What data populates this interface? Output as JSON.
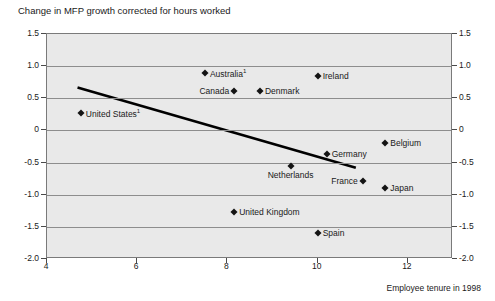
{
  "chart_data": {
    "type": "scatter",
    "title": "Change in MFP growth corrected for hours worked",
    "xlabel": "Employee tenure in 1998",
    "ylabel": "",
    "xlim": [
      4,
      13
    ],
    "ylim": [
      -2.0,
      1.5
    ],
    "xticks": [
      4,
      6,
      8,
      10,
      12
    ],
    "yticks": [
      1.5,
      1.0,
      0.5,
      0,
      -0.5,
      -1.0,
      -1.5,
      -2.0
    ],
    "ytick_labels_left": [
      "1.5",
      "1.0",
      "0.5",
      "0",
      "-0.5",
      "-1.0",
      "-1.5",
      "-2.0"
    ],
    "ytick_labels_right": [
      "1.5",
      "1.0",
      "0.5",
      "0",
      "-0.5",
      "-1.0",
      "-1.5",
      "-2.0"
    ],
    "grid": true,
    "legend": "none",
    "points": [
      {
        "name": "Australia",
        "label": "Australia",
        "footnote": "1",
        "x": 7.5,
        "y": 0.9,
        "label_pos": "right"
      },
      {
        "name": "Ireland",
        "label": "Ireland",
        "footnote": "",
        "x": 10.0,
        "y": 0.85,
        "label_pos": "right"
      },
      {
        "name": "Canada",
        "label": "Canada",
        "footnote": "",
        "x": 8.15,
        "y": 0.62,
        "label_pos": "left"
      },
      {
        "name": "Denmark",
        "label": "Denmark",
        "footnote": "",
        "x": 8.72,
        "y": 0.62,
        "label_pos": "right"
      },
      {
        "name": "United States",
        "label": "United States",
        "footnote": "1",
        "x": 4.75,
        "y": 0.27,
        "label_pos": "right"
      },
      {
        "name": "Belgium",
        "label": "Belgium",
        "footnote": "",
        "x": 11.5,
        "y": -0.2,
        "label_pos": "right"
      },
      {
        "name": "Germany",
        "label": "Germany",
        "footnote": "",
        "x": 10.2,
        "y": -0.37,
        "label_pos": "right"
      },
      {
        "name": "Netherlands",
        "label": "Netherlands",
        "footnote": "",
        "x": 9.4,
        "y": -0.55,
        "label_pos": "below"
      },
      {
        "name": "France",
        "label": "France",
        "footnote": "",
        "x": 11.0,
        "y": -0.78,
        "label_pos": "left"
      },
      {
        "name": "Japan",
        "label": "Japan",
        "footnote": "",
        "x": 11.5,
        "y": -0.9,
        "label_pos": "right"
      },
      {
        "name": "United Kingdom",
        "label": "United Kingdom",
        "footnote": "",
        "x": 8.15,
        "y": -1.27,
        "label_pos": "right"
      },
      {
        "name": "Spain",
        "label": "Spain",
        "footnote": "",
        "x": 10.0,
        "y": -1.6,
        "label_pos": "right"
      }
    ],
    "trendline": {
      "x0": 4.68,
      "y0": 0.66,
      "x1": 10.88,
      "y1": -0.6
    },
    "colors": {
      "plot_background": "#e9e9e9",
      "gridline": "#8d8d8d",
      "frame": "#7a7a7a",
      "marker": "#141414",
      "trendline": "#000000",
      "text": "#1a1a1a"
    }
  }
}
